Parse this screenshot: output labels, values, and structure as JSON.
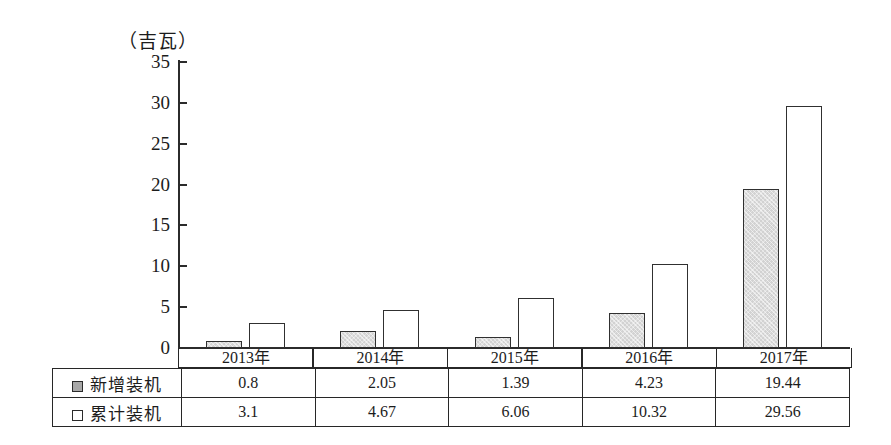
{
  "chart_data": {
    "type": "bar",
    "title": "",
    "subtitle": "",
    "xlabel": "",
    "ylabel": "吉瓦",
    "unit_label": "（吉瓦）",
    "categories": [
      "2013年",
      "2014年",
      "2015年",
      "2016年",
      "2017年"
    ],
    "series": [
      {
        "name": "新增装机",
        "values": [
          0.8,
          2.05,
          1.39,
          4.23,
          19.44
        ],
        "fill": "#d2d2d2",
        "stroke": "#303030"
      },
      {
        "name": "累计装机",
        "values": [
          3.1,
          4.67,
          6.06,
          10.32,
          29.56
        ],
        "fill": "#ffffff",
        "stroke": "#303030"
      }
    ],
    "ylim": [
      0,
      35
    ],
    "yticks": [
      0,
      5,
      10,
      15,
      20,
      25,
      30,
      35
    ],
    "ytick_labels": [
      "0",
      "5",
      "10",
      "15",
      "20",
      "25",
      "30",
      "35"
    ],
    "grid": false,
    "legend_position": "table-row-headers"
  },
  "table": {
    "year_headers": [
      "2013年",
      "2014年",
      "2015年",
      "2016年",
      "2017年"
    ],
    "rows": [
      {
        "label": "新增装机",
        "swatch": "filled-square-icon",
        "values": [
          "0.8",
          "2.05",
          "1.39",
          "4.23",
          "19.44"
        ]
      },
      {
        "label": "累计装机",
        "swatch": "hollow-square-icon",
        "values": [
          "3.1",
          "4.67",
          "6.06",
          "10.32",
          "29.56"
        ]
      }
    ]
  },
  "axis": {
    "y_unit": "（吉瓦）",
    "y_tick_labels": [
      "35",
      "30",
      "25",
      "20",
      "15",
      "10",
      "5",
      "0"
    ]
  },
  "colors": {
    "added_fill": "#d2d2d2",
    "total_fill": "#ffffff",
    "stroke": "#303030",
    "axis": "#2b2b2b",
    "text": "#1c1c1c",
    "background": "#ffffff"
  }
}
